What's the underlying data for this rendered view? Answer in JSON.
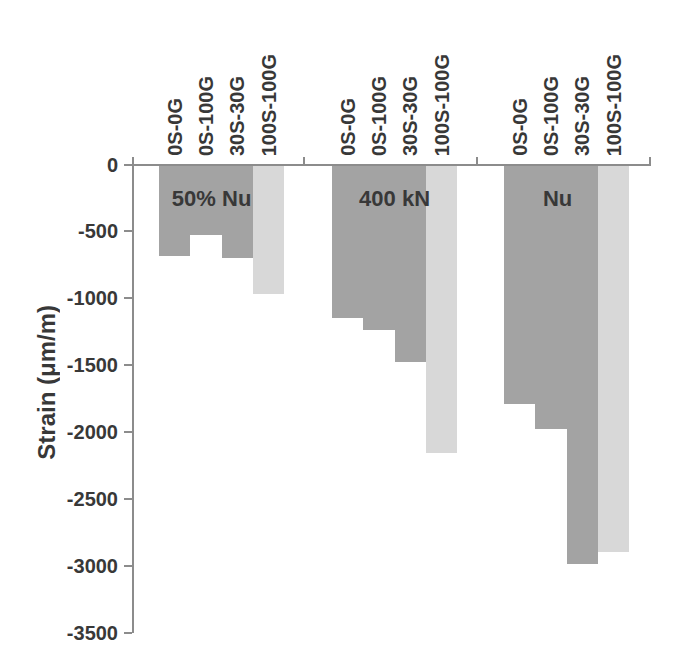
{
  "chart_data": {
    "type": "bar",
    "title": "",
    "xlabel": "",
    "ylabel": "Strain (μm/m)",
    "ylim": [
      -3500,
      0
    ],
    "yticks": [
      0,
      -500,
      -1000,
      -1500,
      -2000,
      -2500,
      -3000,
      -3500
    ],
    "grid": false,
    "legend_position": "none",
    "categories": [
      "50% Nu",
      "400 kN",
      "Nu"
    ],
    "series": [
      {
        "name": "0S-0G",
        "color": "#a3a3a3",
        "values": [
          -690,
          -1150,
          -1790
        ]
      },
      {
        "name": "0S-100G",
        "color": "#a3a3a3",
        "values": [
          -530,
          -1240,
          -1980
        ]
      },
      {
        "name": "30S-30G",
        "color": "#a3a3a3",
        "values": [
          -700,
          -1480,
          -2990
        ]
      },
      {
        "name": "100S-100G",
        "color": "#d8d8d8",
        "values": [
          -970,
          -2160,
          -2900
        ]
      }
    ],
    "axis_color": "#8c8c8c",
    "text_color": "#383838",
    "background_color": "#ffffff"
  }
}
